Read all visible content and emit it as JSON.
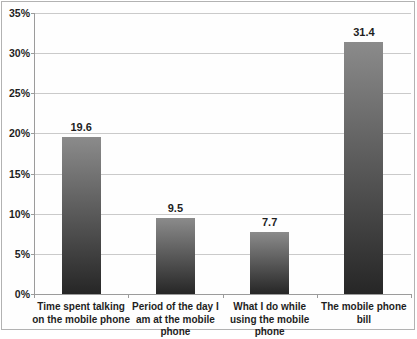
{
  "chart": {
    "background": "#fefefe",
    "border_color": "#b2b2b2"
  },
  "chart_data": {
    "type": "bar",
    "title": "",
    "xlabel": "",
    "ylabel": "",
    "categories": [
      "Time spent talking on the mobile phone",
      "Period of the day I am at the mobile phone",
      "What I do while using the mobile phone",
      "The mobile phone bill"
    ],
    "values": [
      19.6,
      9.5,
      7.7,
      31.4
    ],
    "data_labels": [
      "19.6",
      "9.5",
      "7.7",
      "31.4"
    ],
    "ylim": [
      0,
      35
    ],
    "y_tick_interval": 5,
    "y_tick_labels": [
      "0%",
      "5%",
      "10%",
      "15%",
      "20%",
      "25%",
      "30%",
      "35%"
    ],
    "grid": true,
    "legend": false,
    "colors": {
      "bar_gradient_top": "#8b8b8b",
      "bar_gradient_bottom": "#262626",
      "gridline": "#cacaca",
      "axis": "#9b9b9b",
      "text": "#1e1e1e"
    }
  }
}
